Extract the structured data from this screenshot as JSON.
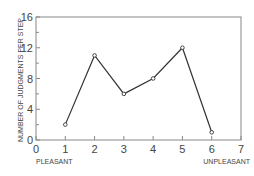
{
  "chart_data": {
    "type": "line",
    "title": "",
    "xlabel": "",
    "ylabel": "NUMBER OF JUDGMENTS PER STEP",
    "x": [
      1,
      2,
      3,
      4,
      5,
      6
    ],
    "values": [
      2,
      11,
      6,
      8,
      12,
      1
    ],
    "xlim": [
      0,
      7
    ],
    "ylim": [
      0,
      16
    ],
    "xticks": [
      "0",
      "1",
      "2",
      "3",
      "4",
      "5",
      "6",
      "7"
    ],
    "yticks": [
      "0",
      "4",
      "8",
      "12",
      "16"
    ],
    "annotations": [
      {
        "text": "PLEASANT",
        "at_x": 1
      },
      {
        "text": "UNPLEASANT",
        "at_x": 6
      }
    ],
    "grid": false,
    "marker": "open-circle"
  },
  "labels": {
    "ylabel": "NUMBER OF JUDGMENTS PER STEP",
    "pleasant": "PLEASANT",
    "unpleasant": "UNPLEASANT"
  }
}
